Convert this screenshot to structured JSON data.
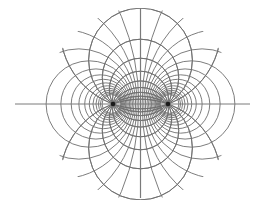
{
  "diagram": {
    "type": "bipolar-coordinates",
    "colors": {
      "background": "#ffffff",
      "line": "#6e6e6e",
      "axis": "#7a7a7a",
      "focus": "#1a1a1a"
    },
    "center": {
      "x": 140.5,
      "y": 104
    },
    "focal_half_distance": 27.5,
    "foci": [
      {
        "label": "",
        "x": 113,
        "y": 104
      },
      {
        "label": "",
        "x": 168,
        "y": 104
      }
    ],
    "axis_horizontal": {
      "x1": 15,
      "x2": 250,
      "y": 104
    },
    "axis_vertical": {
      "x": 140.5,
      "y1": 8,
      "y2": 198
    },
    "apollonian_taus": [
      0.12,
      0.24,
      0.36,
      0.48,
      0.6,
      0.72,
      0.84,
      0.96,
      1.08,
      1.2,
      1.32,
      1.44,
      1.56,
      1.68,
      1.8
    ],
    "field_line_sigmas_deg": [
      20,
      32,
      46,
      62,
      80,
      100,
      118,
      134,
      148,
      160
    ],
    "clip_radius": 96
  }
}
